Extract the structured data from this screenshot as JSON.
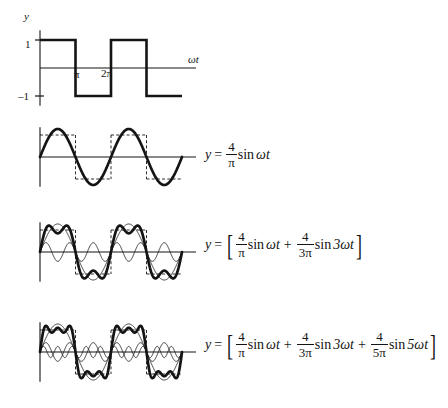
{
  "figure": {
    "title_alt": "Fourier series synthesis of a square wave",
    "background": "#ffffff",
    "ink": "#141414",
    "width": 448,
    "height": 408
  },
  "axes": {
    "y_label": "y",
    "x_label": "ωt",
    "tick_pos_1": "1",
    "tick_neg_1": "–1",
    "tick_pi": "π",
    "tick_2pi": "2π"
  },
  "panels": [
    {
      "name": "square-wave",
      "kind": "square",
      "show_axis_labels": true,
      "equation": null,
      "curves": [
        {
          "role": "square-wave",
          "weight": 2.4,
          "dash": false
        }
      ]
    },
    {
      "name": "first-harmonic",
      "kind": "series",
      "show_axis_labels": false,
      "equation_id": "eq1",
      "harmonics": [
        1
      ],
      "show_components": false
    },
    {
      "name": "first-and-third-harmonic",
      "kind": "series",
      "show_axis_labels": false,
      "equation_id": "eq2",
      "harmonics": [
        1,
        3
      ],
      "show_components": true
    },
    {
      "name": "first-third-fifth-harmonic",
      "kind": "series",
      "show_axis_labels": false,
      "equation_id": "eq3",
      "harmonics": [
        1,
        3,
        5
      ],
      "show_components": true
    }
  ],
  "equations": {
    "eq1": {
      "lhs": "y",
      "eq": "=",
      "terms": [
        {
          "num": "4",
          "den": "π",
          "fn": "sin",
          "arg": "ωt"
        }
      ],
      "brackets": false,
      "plain": "y = (4/π) sin ωt"
    },
    "eq2": {
      "lhs": "y",
      "eq": "=",
      "terms": [
        {
          "num": "4",
          "den": "π",
          "fn": "sin",
          "arg": "ωt"
        },
        {
          "num": "4",
          "den": "3π",
          "fn": "sin",
          "arg": "3ωt"
        }
      ],
      "plus": "+",
      "brackets": true,
      "plain": "y = [(4/π) sin ωt + (4/3π) sin 3ωt]"
    },
    "eq3": {
      "lhs": "y",
      "eq": "=",
      "terms": [
        {
          "num": "4",
          "den": "π",
          "fn": "sin",
          "arg": "ωt"
        },
        {
          "num": "4",
          "den": "3π",
          "fn": "sin",
          "arg": "3ωt"
        },
        {
          "num": "4",
          "den": "5π",
          "fn": "sin",
          "arg": "5ωt"
        }
      ],
      "plus": "+",
      "brackets": true,
      "plain": "y = [(4/π) sin ωt + (4/3π) sin 3ωt + (4/5π) sin 5ωt]"
    }
  },
  "chart_data": {
    "type": "line",
    "xlabel": "ωt",
    "ylabel": "y",
    "xlim": [
      0,
      12.566
    ],
    "ylim": [
      -1.6,
      1.6
    ],
    "xticks": [
      3.1416,
      6.2832
    ],
    "xticklabels": [
      "π",
      "2π"
    ],
    "yticks": [
      -1,
      1
    ],
    "yticklabels": [
      "–1",
      "1"
    ],
    "grid": false,
    "legend": "none",
    "panels": [
      {
        "panel": 1,
        "series": [
          {
            "name": "square wave",
            "amplitude": 1,
            "style": "thick-solid",
            "description": "ideal square wave, +1 on (0,π), –1 on (π,2π), period 2π"
          }
        ]
      },
      {
        "panel": 2,
        "series": [
          {
            "name": "4/π sin ωt",
            "coefficient": 1.2732,
            "harmonic": 1,
            "style": "thick-solid"
          },
          {
            "name": "square outline",
            "amplitude": 1,
            "style": "dashed"
          }
        ]
      },
      {
        "panel": 3,
        "series": [
          {
            "name": "4/π sin ωt",
            "coefficient": 1.2732,
            "harmonic": 1,
            "style": "thin-solid"
          },
          {
            "name": "4/3π sin 3ωt",
            "coefficient": 0.4244,
            "harmonic": 3,
            "style": "thin-solid"
          },
          {
            "name": "sum",
            "coefficients": [
              1.2732,
              0.4244
            ],
            "harmonics": [
              1,
              3
            ],
            "style": "thick-solid"
          },
          {
            "name": "square outline",
            "amplitude": 1,
            "style": "dashed"
          }
        ]
      },
      {
        "panel": 4,
        "series": [
          {
            "name": "4/π sin ωt",
            "coefficient": 1.2732,
            "harmonic": 1,
            "style": "thin-solid"
          },
          {
            "name": "4/3π sin 3ωt",
            "coefficient": 0.4244,
            "harmonic": 3,
            "style": "thin-solid"
          },
          {
            "name": "4/5π sin 5ωt",
            "coefficient": 0.2546,
            "harmonic": 5,
            "style": "thin-solid"
          },
          {
            "name": "sum",
            "coefficients": [
              1.2732,
              0.4244,
              0.2546
            ],
            "harmonics": [
              1,
              3,
              5
            ],
            "style": "thick-solid"
          },
          {
            "name": "square outline",
            "amplitude": 1,
            "style": "dashed"
          }
        ]
      }
    ]
  }
}
